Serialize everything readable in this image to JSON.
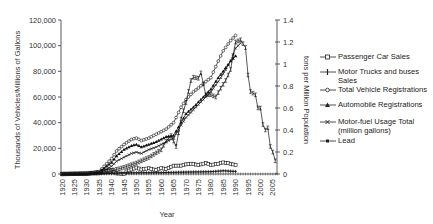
{
  "chart_data": {
    "type": "line",
    "title": "",
    "xlabel": "Year",
    "ylabel": "Thousands of Vehicles/Millions of Gallons",
    "y2label": "tons per Million Population",
    "xlim": [
      1920,
      2008
    ],
    "ylim": [
      0,
      120000
    ],
    "y2lim": [
      0,
      1.4
    ],
    "x_ticks": [
      "1920",
      "1925",
      "1930",
      "1935",
      "1940",
      "1945",
      "1950",
      "1955",
      "1960",
      "1965",
      "1970",
      "1975",
      "1980",
      "1985",
      "1990",
      "1995",
      "2000",
      "2005"
    ],
    "y_ticks": [
      "0",
      "20,000",
      "40,000",
      "60,000",
      "80,000",
      "100,000",
      "120,000"
    ],
    "y2_ticks": [
      "0",
      "0.2",
      "0.4",
      "0.6",
      "0.8",
      "1",
      "1.2",
      "1.4"
    ],
    "grid": false,
    "legend_position": "right",
    "series": [
      {
        "name": "Passenger Car Sales",
        "axis": "left",
        "marker": "square-open",
        "x": [
          1920,
          1925,
          1930,
          1935,
          1940,
          1942,
          1945,
          1946,
          1948,
          1950,
          1952,
          1955,
          1958,
          1960,
          1962,
          1965,
          1968,
          1970,
          1972,
          1975,
          1978,
          1980,
          1983,
          1985,
          1987,
          1990
        ],
        "y": [
          0,
          0,
          100,
          1500,
          3000,
          500,
          100,
          2000,
          3500,
          5000,
          3500,
          4500,
          3000,
          4500,
          4000,
          6500,
          6500,
          7500,
          8000,
          7000,
          8500,
          7000,
          8000,
          9000,
          8500,
          7000
        ]
      },
      {
        "name": "Motor Trucks and buses Sales",
        "axis": "left",
        "marker": "plus",
        "x": [
          1920,
          1930,
          1940,
          1950,
          1960,
          1970,
          1980,
          1985,
          1990
        ],
        "y": [
          0,
          200,
          500,
          1000,
          1100,
          1500,
          1800,
          2500,
          2000
        ]
      },
      {
        "name": "Total Vehicle Registrations",
        "axis": "left",
        "marker": "circle-open",
        "x": [
          1920,
          1930,
          1935,
          1940,
          1942,
          1945,
          1948,
          1950,
          1952,
          1955,
          1958,
          1960,
          1962,
          1965,
          1968,
          1970,
          1973,
          1975,
          1978,
          1980,
          1983,
          1985,
          1988,
          1990
        ],
        "y": [
          0,
          200,
          2000,
          12000,
          18000,
          23000,
          27000,
          28000,
          26000,
          28000,
          31000,
          33000,
          35000,
          40000,
          52000,
          58000,
          64000,
          67000,
          72000,
          75000,
          88000,
          96000,
          104000,
          108000
        ]
      },
      {
        "name": "Automobile Registrations",
        "axis": "left",
        "marker": "triangle-filled",
        "x": [
          1920,
          1930,
          1935,
          1940,
          1942,
          1945,
          1948,
          1950,
          1952,
          1955,
          1958,
          1960,
          1962,
          1965,
          1968,
          1970,
          1973,
          1975,
          1978,
          1980,
          1983,
          1985,
          1988,
          1990
        ],
        "y": [
          0,
          200,
          1500,
          9000,
          14000,
          19000,
          22000,
          23000,
          21000,
          23000,
          25000,
          27000,
          29000,
          30000,
          40000,
          47000,
          52000,
          56000,
          62000,
          66000,
          75000,
          80000,
          88000,
          92000
        ]
      },
      {
        "name": "Motor-fuel Usage Total (million gallons)",
        "axis": "left",
        "marker": "x",
        "x": [
          1920,
          1930,
          1935,
          1940,
          1942,
          1945,
          1948,
          1950,
          1952,
          1955,
          1958,
          1960,
          1962,
          1965,
          1968,
          1970,
          1973,
          1975,
          1978,
          1980,
          1983,
          1985,
          1988,
          1990,
          1992
        ],
        "y": [
          0,
          100,
          500,
          6000,
          10000,
          13000,
          16000,
          17000,
          16000,
          19000,
          21000,
          23000,
          25000,
          28000,
          38000,
          44000,
          50000,
          54000,
          60000,
          64000,
          72000,
          78000,
          88000,
          98000,
          102000
        ]
      },
      {
        "name": "Lead",
        "axis": "right",
        "marker": "asterisk",
        "x": [
          1920,
          1935,
          1940,
          1945,
          1950,
          1955,
          1960,
          1962,
          1964,
          1966,
          1968,
          1970,
          1972,
          1973,
          1975,
          1976,
          1978,
          1980,
          1982,
          1984,
          1986,
          1988,
          1990,
          1992,
          1994,
          1995,
          1996,
          1998,
          1999,
          2000,
          2001,
          2002,
          2003,
          2004,
          2005,
          2006
        ],
        "y": [
          0,
          0.01,
          0.03,
          0.06,
          0.1,
          0.15,
          0.22,
          0.3,
          0.35,
          0.25,
          0.5,
          0.65,
          0.85,
          0.88,
          0.87,
          0.92,
          0.72,
          0.72,
          0.7,
          0.78,
          0.85,
          0.95,
          1.2,
          1.22,
          1.15,
          0.9,
          0.75,
          0.72,
          0.6,
          0.6,
          0.45,
          0.4,
          0.42,
          0.25,
          0.2,
          0.12
        ]
      }
    ]
  },
  "legend": {
    "items": [
      {
        "label": "Passenger Car Sales"
      },
      {
        "label": "Motor Trucks and buses Sales"
      },
      {
        "label": "Total Vehicle Registrations"
      },
      {
        "label": "Automobile Registrations"
      },
      {
        "label": "Motor-fuel Usage Total (million gallons)"
      },
      {
        "label": "Lead"
      }
    ]
  }
}
